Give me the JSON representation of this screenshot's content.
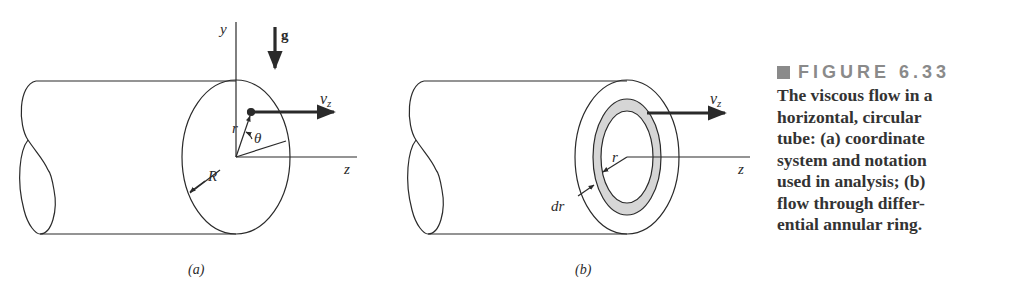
{
  "figure": {
    "number_label": "FIGURE 6.33",
    "caption_lines": [
      "The viscous flow in a",
      "horizontal, circular",
      "tube: (a) coordinate",
      "system and notation",
      "used in analysis; (b)",
      "flow through differ-",
      "ential annular ring."
    ],
    "colors": {
      "line": "#2a2a2a",
      "ring_fill": "#d6d6d6",
      "figure_label": "#8a8a8a",
      "caption_text": "#333333"
    }
  },
  "panel_a": {
    "label": "(a)",
    "axis_y": "y",
    "axis_z": "z",
    "gravity": "g",
    "velocity": "v",
    "velocity_sub": "z",
    "radius_small": "r",
    "angle": "θ",
    "radius_large": "R"
  },
  "panel_b": {
    "label": "(b)",
    "axis_z": "z",
    "velocity": "v",
    "velocity_sub": "z",
    "radius": "r",
    "ring_thickness": "dr"
  }
}
